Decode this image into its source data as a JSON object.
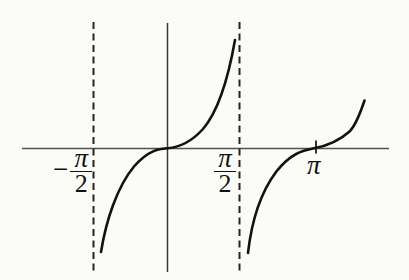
{
  "figure": {
    "background": "#fbfbf8"
  },
  "labels": {
    "neg_half_pi": {
      "minus": "−",
      "numerator": "π",
      "denominator": "2"
    },
    "pos_half_pi": {
      "numerator": "π",
      "denominator": "2"
    },
    "pi": {
      "text": "π"
    }
  },
  "chart_data": {
    "type": "line",
    "title": "",
    "xlabel": "",
    "ylabel": "",
    "function": "y = tan(x)",
    "grid": false,
    "legend": "none",
    "x_tick_labels": [
      "−π/2",
      "π/2",
      "π"
    ],
    "x_ticks_radians": [
      -1.5708,
      1.5708,
      3.1416
    ],
    "vertical_asymptotes_radians": [
      -1.5708,
      1.5708
    ],
    "zeros_radians": [
      0,
      3.1416
    ],
    "x_axis_range_radians": [
      -3.13,
      4.77
    ],
    "branches": [
      {
        "interval_radians": [
          -1.43,
          1.46
        ],
        "passes_through": "(0, 0)",
        "shape": "increasing"
      },
      {
        "interval_radians": [
          1.74,
          4.22
        ],
        "passes_through": "(π, 0)",
        "shape": "increasing"
      }
    ],
    "pixel_geometry": {
      "canvas": {
        "w": 409,
        "h": 280
      },
      "x_axis": {
        "y": 148.5,
        "x1": 22,
        "x2": 389,
        "color": "#55524e",
        "width": 1.7
      },
      "y_axis": {
        "x": 167.5,
        "y1": 23,
        "y2": 272,
        "color": "#3c3a37",
        "width": 1.5
      },
      "asymptotes": {
        "xs": [
          93.5,
          239.5
        ],
        "y1": 22,
        "y2": 272,
        "dash": "7 4.5",
        "color": "#262422",
        "width": 2
      },
      "pi_tick": {
        "x": 316,
        "y1": 140.5,
        "y2": 153.5,
        "color": "#1d1c1a",
        "width": 1.8
      },
      "curve": {
        "color": "#131210",
        "width": 2.6
      },
      "branch_paths": [
        "M 101,252 C 106,221 117,187 134,166.5 C 149,149.5 159.5,148.9 167.5,148.2 C 177,147.4 190,143.5 203,129 C 217.5,112 228.5,77 235,40",
        "M 248,253 C 251.5,222 260,193.5 276,172 C 290,154 302,150.6 314,148.3 C 327,145.9 339,141 349.5,131.5 C 356.5,124.5 361,111 364.5,100.5"
      ]
    }
  }
}
